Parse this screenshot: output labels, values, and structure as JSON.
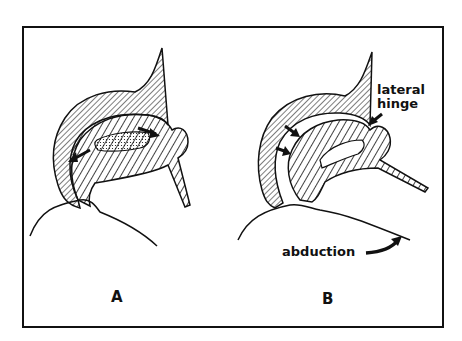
{
  "figure": {
    "panels": [
      {
        "id": "A",
        "label": "A"
      },
      {
        "id": "B",
        "label": "B"
      }
    ],
    "annotations": {
      "lateral_hinge_line1": "lateral",
      "lateral_hinge_line2": "hinge",
      "abduction": "abduction"
    },
    "colors": {
      "ink": "#111111",
      "background": "#ffffff"
    }
  }
}
